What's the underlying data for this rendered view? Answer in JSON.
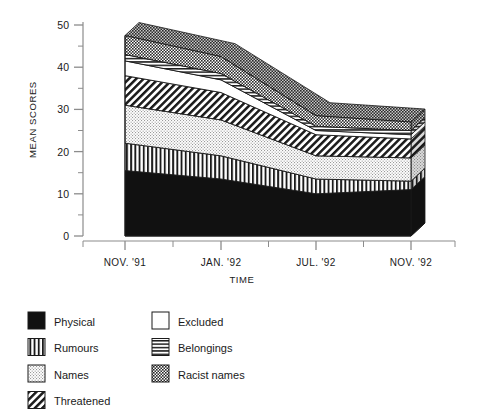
{
  "chart_data": {
    "type": "area",
    "title": "",
    "subtitle": "",
    "xlabel": "TIME",
    "ylabel": "MEAN SCORES",
    "stacked": true,
    "three_d": true,
    "grid": false,
    "legend_position": "bottom-left",
    "ylim": [
      0,
      50
    ],
    "yticks": [
      0,
      10,
      20,
      30,
      40,
      50
    ],
    "ytick_labels": [
      "0",
      "10",
      "20",
      "30",
      "40",
      "50"
    ],
    "yminor_step": 5,
    "categories": [
      "NOV. '91",
      "JAN. '92",
      "JUL. '92",
      "NOV. '92"
    ],
    "x": [
      "NOV. '91",
      "JAN. '92",
      "JUL. '92",
      "NOV. '92"
    ],
    "xtick_labels": [
      "NOV. '91",
      "JAN. '92",
      "JUL. '92",
      "NOV. '92"
    ],
    "series": [
      {
        "name": "Physical",
        "pattern": "solid-black",
        "values": [
          15.5,
          13.5,
          10.0,
          11.0
        ]
      },
      {
        "name": "Rumours",
        "pattern": "vertical-lines",
        "values": [
          6.5,
          5.5,
          3.5,
          2.0
        ]
      },
      {
        "name": "Names",
        "pattern": "light-stipple",
        "values": [
          9.0,
          8.5,
          5.5,
          5.5
        ]
      },
      {
        "name": "Threatened",
        "pattern": "diagonal-hatch",
        "values": [
          7.0,
          6.5,
          5.0,
          4.5
        ]
      },
      {
        "name": "Excluded",
        "pattern": "white",
        "values": [
          3.5,
          3.0,
          1.0,
          1.0
        ]
      },
      {
        "name": "Belongings",
        "pattern": "horizontal-lines",
        "values": [
          1.5,
          1.5,
          1.0,
          1.0
        ]
      },
      {
        "name": "Racist names",
        "pattern": "dark-checker",
        "values": [
          4.5,
          4.0,
          2.5,
          2.0
        ]
      }
    ],
    "cumulative_tops": {
      "NOV. '91": [
        15.5,
        22.0,
        31.0,
        38.0,
        41.5,
        43.0,
        47.5
      ],
      "JAN. '92": [
        13.5,
        19.0,
        27.5,
        34.0,
        37.0,
        38.5,
        42.5
      ],
      "JUL. '92": [
        10.0,
        13.5,
        19.0,
        24.0,
        25.0,
        26.0,
        28.5
      ],
      "NOV. '92": [
        11.0,
        13.0,
        18.5,
        23.0,
        24.0,
        25.0,
        27.0
      ]
    },
    "totals": [
      47.5,
      42.5,
      28.5,
      27.0
    ],
    "annotations": []
  },
  "axis": {
    "y_title": "MEAN SCORES",
    "x_title": "TIME"
  },
  "legend": {
    "column_left": [
      {
        "label": "Physical",
        "pattern": "solid-black"
      },
      {
        "label": "Rumours",
        "pattern": "vertical-lines"
      },
      {
        "label": "Names",
        "pattern": "light-stipple"
      },
      {
        "label": "Threatened",
        "pattern": "diagonal-hatch"
      }
    ],
    "column_right": [
      {
        "label": "Excluded",
        "pattern": "white"
      },
      {
        "label": "Belongings",
        "pattern": "horizontal-lines"
      },
      {
        "label": "Racist names",
        "pattern": "dark-checker"
      }
    ]
  },
  "colors": {
    "ink": "#1a1a1a",
    "axis": "#8c8c8c",
    "black_fill": "#111111",
    "white_fill": "#ffffff",
    "stipple_fill": "#e3e3e3",
    "checker_fill": "#5a5a5a"
  }
}
